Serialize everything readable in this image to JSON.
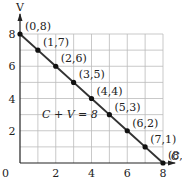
{
  "chart_data": {
    "type": "line",
    "title": "",
    "xlabel": "C",
    "ylabel": "V",
    "xlim": [
      0,
      8
    ],
    "ylim": [
      0,
      8
    ],
    "grid": true,
    "x_ticks": [
      "0",
      "2",
      "4",
      "6",
      "8"
    ],
    "y_ticks": [
      "2",
      "4",
      "6",
      "8"
    ],
    "annotation": "C + V = 8",
    "series": [
      {
        "name": "C + V = 8",
        "points": [
          {
            "x": 0,
            "y": 8,
            "label": "(0,8)"
          },
          {
            "x": 1,
            "y": 7,
            "label": "(1,7)"
          },
          {
            "x": 2,
            "y": 6,
            "label": "(2,6)"
          },
          {
            "x": 3,
            "y": 5,
            "label": "(3,5)"
          },
          {
            "x": 4,
            "y": 4,
            "label": "(4,4)"
          },
          {
            "x": 5,
            "y": 3,
            "label": "(5,3)"
          },
          {
            "x": 6,
            "y": 2,
            "label": "(6,2)"
          },
          {
            "x": 7,
            "y": 1,
            "label": "(7,1)"
          },
          {
            "x": 8,
            "y": 0,
            "label": "(8,0)"
          }
        ]
      }
    ],
    "colors": {
      "line": "#333333",
      "grid": "#bbbbbb",
      "axis": "#222222"
    }
  }
}
